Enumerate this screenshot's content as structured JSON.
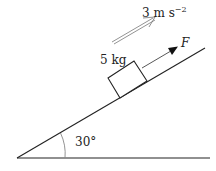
{
  "diagram": {
    "type": "inclined-plane-free-body",
    "angle_label": "30°",
    "angle_deg": 30,
    "mass_label": "5 kg",
    "force_label": "F",
    "acceleration": {
      "value": "3",
      "unit_base": "m s",
      "unit_exp": "−2"
    },
    "colors": {
      "line": "#222222",
      "arc": "#888888",
      "accel_arrow": "#777777"
    }
  }
}
